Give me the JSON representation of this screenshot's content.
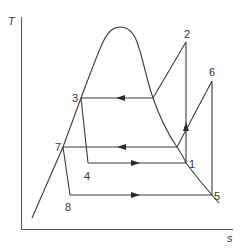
{
  "diagram": {
    "type": "T-s diagram (two-stage vapor compression refrigeration cycle)",
    "axes": {
      "y_label": "T",
      "x_label": "s"
    },
    "points": [
      {
        "id": "1",
        "label": "1",
        "x": 186,
        "y": 163
      },
      {
        "id": "2",
        "label": "2",
        "x": 186,
        "y": 42
      },
      {
        "id": "3",
        "label": "3",
        "x": 81,
        "y": 98
      },
      {
        "id": "4",
        "label": "4",
        "x": 88,
        "y": 163
      },
      {
        "id": "5",
        "label": "5",
        "x": 212,
        "y": 195
      },
      {
        "id": "6",
        "label": "6",
        "x": 212,
        "y": 81
      },
      {
        "id": "7",
        "label": "7",
        "x": 63,
        "y": 147
      },
      {
        "id": "8",
        "label": "8",
        "x": 70,
        "y": 195
      }
    ],
    "processes": [
      {
        "from": "1",
        "to": "2",
        "kind": "compression",
        "arrow": "up"
      },
      {
        "from": "2",
        "to": "3",
        "kind": "condensation",
        "arrow": "left"
      },
      {
        "from": "3",
        "to": "4",
        "kind": "throttling"
      },
      {
        "from": "4",
        "to": "1",
        "kind": "evaporation",
        "arrow": "right"
      },
      {
        "from": "5",
        "to": "6",
        "kind": "compression"
      },
      {
        "from": "6",
        "to": "7",
        "kind": "condensation",
        "arrow": "left"
      },
      {
        "from": "7",
        "to": "8",
        "kind": "throttling"
      },
      {
        "from": "8",
        "to": "5",
        "kind": "evaporation",
        "arrow": "right"
      }
    ],
    "saturation_dome": "bell curve, peak near top-center"
  }
}
